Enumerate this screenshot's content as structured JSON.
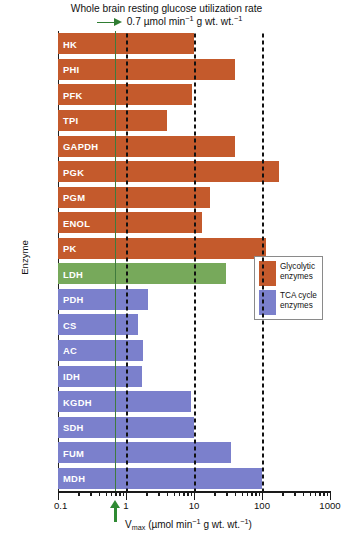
{
  "title": {
    "line1": "Whole brain resting glucose utilization rate",
    "value": "0.7",
    "units_prefix": "µmol min",
    "units_sup1": "−1",
    "units_mid": " g wt. wt.",
    "units_sup2": "−1",
    "arrow_color": "#2f7d32"
  },
  "axes": {
    "ylabel": "Enzyme",
    "xlabel_main": "V",
    "xlabel_sub": "max",
    "xlabel_units_open": " (µmol min",
    "xlabel_sup1": "−1",
    "xlabel_units_mid": " g wt. wt.",
    "xlabel_sup2": "−1",
    "xlabel_units_close": ")",
    "tick_labels": [
      "0.1",
      "1",
      "10",
      "100",
      "1000"
    ],
    "xlim": [
      0.1,
      1000
    ],
    "scale": "log",
    "grid": "dashed vertical lines at 1, 10, 100; solid green line at 0.7"
  },
  "marker_line": {
    "value": 0.7,
    "color": "#3f7b3d",
    "label": "Whole brain resting glucose utilization rate 0.7"
  },
  "legend": {
    "position": "center-right",
    "items": [
      {
        "label": "Glycolytic\nenzymes",
        "color": "#c45a2c"
      },
      {
        "label": "TCA cycle\nenzymes",
        "color": "#7b80cc"
      }
    ]
  },
  "colors": {
    "glycolytic": "#c45a2c",
    "tca": "#7b80cc",
    "ldh": "#77a95b",
    "axis": "#1a1a1a",
    "marker": "#3f7b3d",
    "bar_text": "#ffffff"
  },
  "chart_data": {
    "type": "bar",
    "orientation": "horizontal",
    "title": "Whole brain resting glucose utilization rate",
    "xlabel": "Vmax (µmol min−1 g wt. wt.−1)",
    "ylabel": "Enzyme",
    "xlim": [
      0.1,
      1000
    ],
    "xscale": "log",
    "grid": true,
    "legend_position": "center-right",
    "categories": [
      "HK",
      "PHI",
      "PFK",
      "TPI",
      "GAPDH",
      "PGK",
      "PGM",
      "ENOL",
      "PK",
      "LDH",
      "PDH",
      "CS",
      "AC",
      "IDH",
      "KGDH",
      "SDH",
      "FUM",
      "MDH"
    ],
    "values": [
      10,
      40,
      9.5,
      4,
      40,
      180,
      17,
      13,
      115,
      30,
      2.1,
      1.5,
      1.8,
      1.7,
      9,
      10,
      35,
      100
    ],
    "groups": [
      "glycolytic",
      "glycolytic",
      "glycolytic",
      "glycolytic",
      "glycolytic",
      "glycolytic",
      "glycolytic",
      "glycolytic",
      "glycolytic",
      "ldh",
      "tca",
      "tca",
      "tca",
      "tca",
      "tca",
      "tca",
      "tca",
      "tca"
    ],
    "bars": [
      {
        "label": "HK",
        "value": 10,
        "group": "glycolytic"
      },
      {
        "label": "PHI",
        "value": 40,
        "group": "glycolytic"
      },
      {
        "label": "PFK",
        "value": 9.5,
        "group": "glycolytic"
      },
      {
        "label": "TPI",
        "value": 4,
        "group": "glycolytic"
      },
      {
        "label": "GAPDH",
        "value": 40,
        "group": "glycolytic"
      },
      {
        "label": "PGK",
        "value": 180,
        "group": "glycolytic"
      },
      {
        "label": "PGM",
        "value": 17,
        "group": "glycolytic"
      },
      {
        "label": "ENOL",
        "value": 13,
        "group": "glycolytic"
      },
      {
        "label": "PK",
        "value": 115,
        "group": "glycolytic"
      },
      {
        "label": "LDH",
        "value": 30,
        "group": "ldh"
      },
      {
        "label": "PDH",
        "value": 2.1,
        "group": "tca"
      },
      {
        "label": "CS",
        "value": 1.5,
        "group": "tca"
      },
      {
        "label": "AC",
        "value": 1.8,
        "group": "tca"
      },
      {
        "label": "IDH",
        "value": 1.7,
        "group": "tca"
      },
      {
        "label": "KGDH",
        "value": 9,
        "group": "tca"
      },
      {
        "label": "SDH",
        "value": 10,
        "group": "tca"
      },
      {
        "label": "FUM",
        "value": 35,
        "group": "tca"
      },
      {
        "label": "MDH",
        "value": 100,
        "group": "tca"
      }
    ]
  }
}
